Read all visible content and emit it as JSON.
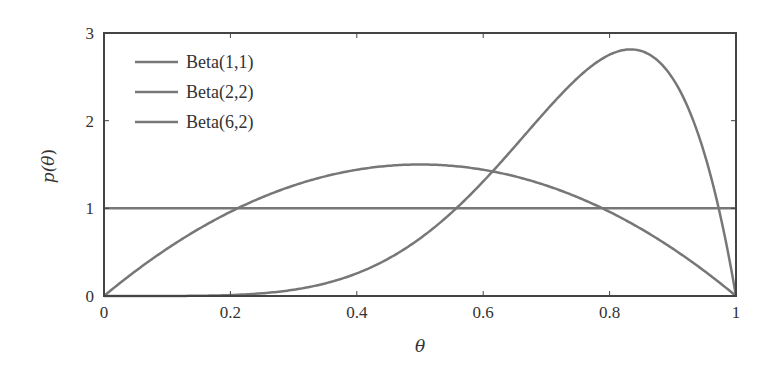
{
  "chart_data": {
    "type": "line",
    "title": "",
    "xlabel": "θ",
    "ylabel": "p(θ)",
    "xlim": [
      0,
      1
    ],
    "ylim": [
      0,
      3
    ],
    "xticks": [
      0,
      0.2,
      0.4,
      0.6,
      0.8,
      1
    ],
    "xtick_labels": [
      "0",
      "0.2",
      "0.4",
      "0.6",
      "0.8",
      "1"
    ],
    "yticks": [
      0,
      1,
      2,
      3
    ],
    "ytick_labels": [
      "0",
      "1",
      "2",
      "3"
    ],
    "grid": false,
    "legend_position": "upper left",
    "series": [
      {
        "name": "Beta(1,1)",
        "alpha": 1,
        "beta": 1,
        "color": "#777777",
        "x": [
          0,
          0.2,
          0.4,
          0.6,
          0.8,
          1
        ],
        "values": [
          1,
          1,
          1,
          1,
          1,
          1
        ]
      },
      {
        "name": "Beta(2,2)",
        "alpha": 2,
        "beta": 2,
        "color": "#777777",
        "x": [
          0,
          0.1,
          0.2,
          0.3,
          0.4,
          0.5,
          0.6,
          0.7,
          0.8,
          0.9,
          1
        ],
        "values": [
          0,
          0.54,
          0.96,
          1.26,
          1.44,
          1.5,
          1.44,
          1.26,
          0.96,
          0.54,
          0
        ]
      },
      {
        "name": "Beta(6,2)",
        "alpha": 6,
        "beta": 2,
        "color": "#777777",
        "x": [
          0,
          0.1,
          0.2,
          0.3,
          0.4,
          0.5,
          0.6,
          0.7,
          0.8,
          0.833,
          0.9,
          1
        ],
        "values": [
          0,
          0.0004,
          0.009,
          0.061,
          0.215,
          0.547,
          1.088,
          1.765,
          2.294,
          2.791,
          2.48,
          0
        ]
      }
    ]
  },
  "legend": {
    "items": [
      {
        "label": "Beta(1,1)"
      },
      {
        "label": "Beta(2,2)"
      },
      {
        "label": "Beta(6,2)"
      }
    ]
  },
  "axes": {
    "x_label": "θ",
    "y_label_prefix": "p(",
    "y_label_var": "θ",
    "y_label_suffix": ")"
  },
  "colors": {
    "line": "#777777",
    "axis": "#444444",
    "text": "#333333"
  }
}
